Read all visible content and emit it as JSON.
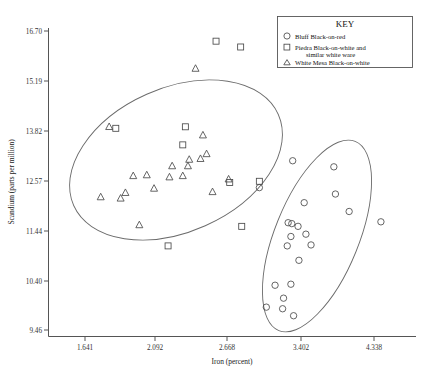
{
  "chart_data": {
    "type": "scatter",
    "title": "",
    "xlabel": "Iron (percent)",
    "ylabel": "Scandium (parts per million)",
    "x_scale": "log",
    "y_scale": "log",
    "xticks": [
      "1.641",
      "2.092",
      "2.668",
      "3.402",
      "4.338"
    ],
    "yticks": [
      "16.70",
      "15.19",
      "13.82",
      "12.57",
      "11.44",
      "10.40",
      "9.46"
    ],
    "xlim": [
      1.45,
      4.9
    ],
    "ylim": [
      9.2,
      17.1
    ],
    "grid": false,
    "legend_position": "top-right",
    "legend_title": "KEY",
    "series": [
      {
        "name": "Bluff Black-on-red",
        "marker": "circle",
        "points": [
          [
            2.95,
            12.4
          ],
          [
            3.3,
            13.05
          ],
          [
            3.43,
            12.05
          ],
          [
            3.79,
            12.9
          ],
          [
            3.81,
            12.25
          ],
          [
            3.99,
            11.85
          ],
          [
            4.44,
            11.62
          ],
          [
            3.25,
            11.6
          ],
          [
            3.29,
            11.58
          ],
          [
            3.36,
            11.52
          ],
          [
            3.28,
            11.3
          ],
          [
            3.24,
            11.1
          ],
          [
            3.45,
            11.35
          ],
          [
            3.51,
            11.12
          ],
          [
            3.37,
            10.8
          ],
          [
            3.11,
            10.3
          ],
          [
            3.28,
            10.32
          ],
          [
            3.2,
            10.05
          ],
          [
            3.02,
            9.88
          ],
          [
            3.19,
            9.85
          ],
          [
            3.31,
            9.72
          ]
        ]
      },
      {
        "name": "Piedra Black-on-white and similar white ware",
        "marker": "square",
        "points": [
          [
            2.55,
            16.38
          ],
          [
            2.77,
            16.2
          ],
          [
            2.3,
            13.92
          ],
          [
            2.28,
            13.45
          ],
          [
            1.82,
            13.88
          ],
          [
            2.67,
            12.52
          ],
          [
            2.95,
            12.55
          ],
          [
            2.78,
            11.52
          ],
          [
            2.17,
            11.1
          ]
        ]
      },
      {
        "name": "White Mesa Black-on-white",
        "marker": "triangle",
        "points": [
          [
            2.38,
            15.55
          ],
          [
            2.44,
            13.7
          ],
          [
            1.78,
            13.92
          ],
          [
            2.2,
            12.92
          ],
          [
            2.32,
            12.92
          ],
          [
            2.33,
            13.08
          ],
          [
            2.42,
            13.1
          ],
          [
            2.47,
            13.22
          ],
          [
            2.28,
            12.68
          ],
          [
            2.52,
            12.3
          ],
          [
            1.93,
            12.68
          ],
          [
            2.02,
            12.7
          ],
          [
            2.18,
            12.65
          ],
          [
            1.73,
            12.18
          ],
          [
            1.85,
            12.15
          ],
          [
            1.88,
            12.28
          ],
          [
            2.07,
            12.38
          ],
          [
            1.97,
            11.55
          ],
          [
            2.66,
            12.6
          ]
        ]
      }
    ]
  },
  "legend": {
    "title": "KEY",
    "entries": [
      {
        "marker": "circle",
        "label": "Bluff Black-on-red",
        "label2": ""
      },
      {
        "marker": "square",
        "label": "Piedra Black-on-white and",
        "label2": "similar white ware"
      },
      {
        "marker": "triangle",
        "label": "White Mesa Black-on-white",
        "label2": ""
      }
    ]
  },
  "ellipses": [
    {
      "name": "left-group-ellipse",
      "cx": 176,
      "cy": 160,
      "rx": 112,
      "ry": 72,
      "rotate": -24
    },
    {
      "name": "right-group-ellipse",
      "cx": 317,
      "cy": 236,
      "rx": 102,
      "ry": 42,
      "rotate": -68
    }
  ],
  "colors": {
    "marker": "#4a4a4a",
    "axis": "#555555",
    "ellipse": "#6b6b6b",
    "background": "#ffffff"
  }
}
